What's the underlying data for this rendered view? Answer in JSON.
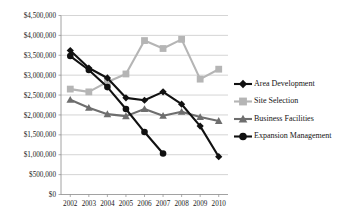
{
  "chart_data": {
    "type": "line",
    "title": "",
    "xlabel": "",
    "ylabel": "",
    "grid": true,
    "legend_position": "right",
    "categories": [
      "2002",
      "2003",
      "2004",
      "2005",
      "2006",
      "2007",
      "2008",
      "2009",
      "2010"
    ],
    "ylim": [
      0,
      4500000
    ],
    "ytick_values": [
      0,
      500000,
      1000000,
      1500000,
      2000000,
      2500000,
      3000000,
      3500000,
      4000000,
      4500000
    ],
    "ytick_labels": [
      "$0",
      "$500,000",
      "$1,000,000",
      "$1,500,000",
      "$2,000,000",
      "$2,500,000",
      "$3,000,000",
      "$3,500,000",
      "$4,000,000",
      "$4,500,000"
    ],
    "series": [
      {
        "name": "Area Development",
        "marker": "diamond",
        "color": "#111111",
        "values": [
          3620000,
          3180000,
          2930000,
          2430000,
          2370000,
          2580000,
          2270000,
          1720000,
          950000
        ]
      },
      {
        "name": "Site Selection",
        "marker": "square",
        "color": "#b5b5b5",
        "values": [
          2650000,
          2580000,
          2830000,
          3030000,
          3870000,
          3670000,
          3900000,
          2900000,
          3150000
        ]
      },
      {
        "name": "Business Facilities",
        "marker": "triangle",
        "color": "#6e6e6e",
        "values": [
          2380000,
          2180000,
          2020000,
          1970000,
          2150000,
          1980000,
          2080000,
          1950000,
          1850000
        ]
      },
      {
        "name": "Expansion Management",
        "marker": "circle",
        "color": "#111111",
        "values": [
          3480000,
          3130000,
          2700000,
          2150000,
          1570000,
          1030000,
          null,
          null,
          null
        ]
      }
    ]
  },
  "legend": {
    "items": [
      {
        "label": "Area Development",
        "marker": "diamond",
        "color": "#111111"
      },
      {
        "label": "Site Selection",
        "marker": "square",
        "color": "#b5b5b5"
      },
      {
        "label": "Business Facilities",
        "marker": "triangle",
        "color": "#6e6e6e"
      },
      {
        "label": "Expansion Management",
        "marker": "circle",
        "color": "#111111"
      }
    ]
  }
}
